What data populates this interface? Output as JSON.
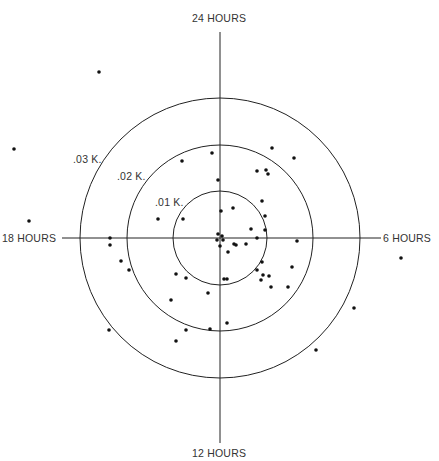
{
  "diagram": {
    "type": "polar-scatter",
    "center": [
      220,
      238
    ],
    "axes": {
      "top_label": "24 HOURS",
      "right_label": "6 HOURS",
      "bottom_label": "12 HOURS",
      "left_label": "18 HOURS"
    },
    "rings": [
      {
        "label": ".01 K.",
        "radius": 47
      },
      {
        "label": ".02 K.",
        "radius": 93
      },
      {
        "label": ".03 K.",
        "radius": 140
      }
    ],
    "colors": {
      "line": "#222222",
      "dot": "#111111",
      "text": "#333333"
    },
    "points": [
      [
        99,
        72
      ],
      [
        14,
        149
      ],
      [
        29,
        221
      ],
      [
        182,
        161
      ],
      [
        212,
        153
      ],
      [
        218,
        180
      ],
      [
        272,
        148
      ],
      [
        294,
        158
      ],
      [
        257,
        171
      ],
      [
        266,
        170
      ],
      [
        268,
        174
      ],
      [
        158,
        219
      ],
      [
        183,
        219
      ],
      [
        262,
        201
      ],
      [
        265,
        216
      ],
      [
        233,
        208
      ],
      [
        251,
        229
      ],
      [
        221,
        211
      ],
      [
        265,
        230
      ],
      [
        110,
        238
      ],
      [
        110,
        245
      ],
      [
        121,
        261
      ],
      [
        129,
        270
      ],
      [
        176,
        274
      ],
      [
        186,
        278
      ],
      [
        171,
        300
      ],
      [
        208,
        293
      ],
      [
        186,
        330
      ],
      [
        176,
        341
      ],
      [
        109,
        330
      ],
      [
        210,
        329
      ],
      [
        227,
        323
      ],
      [
        297,
        241
      ],
      [
        234,
        244
      ],
      [
        228,
        252
      ],
      [
        236,
        245
      ],
      [
        246,
        244
      ],
      [
        257,
        238
      ],
      [
        262,
        262
      ],
      [
        257,
        270
      ],
      [
        263,
        275
      ],
      [
        292,
        267
      ],
      [
        261,
        280
      ],
      [
        269,
        276
      ],
      [
        271,
        287
      ],
      [
        288,
        287
      ],
      [
        227,
        279
      ],
      [
        224,
        279
      ],
      [
        354,
        308
      ],
      [
        316,
        350
      ],
      [
        401,
        258
      ],
      [
        218,
        234
      ],
      [
        222,
        236
      ],
      [
        217,
        240
      ],
      [
        223,
        240
      ],
      [
        220,
        246
      ]
    ]
  }
}
